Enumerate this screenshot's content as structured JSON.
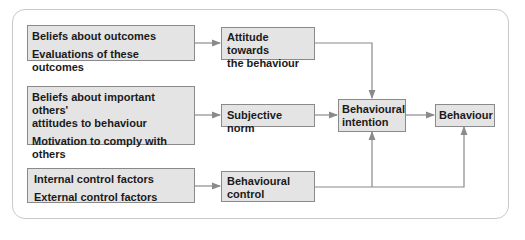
{
  "diagram": {
    "inputs": [
      {
        "lines": [
          "Beliefs about outcomes",
          "Evaluations of these outcomes"
        ]
      },
      {
        "lines": [
          "Beliefs about important others'",
          "attitudes to behaviour",
          "Motivation to comply with",
          "others"
        ]
      },
      {
        "lines": [
          "Internal control factors",
          "External control factors"
        ]
      }
    ],
    "mid": [
      {
        "lines": [
          "Attitude towards",
          "the behaviour"
        ]
      },
      {
        "lines": [
          "Subjective norm"
        ]
      },
      {
        "lines": [
          "Behavioural",
          "control"
        ]
      }
    ],
    "intention": {
      "lines": [
        "Behavioural",
        "intention"
      ]
    },
    "behaviour": {
      "label": "Behaviour"
    },
    "colors": {
      "box_fill": "#e4e4e4",
      "box_border": "#8a8a8a",
      "arrow": "#8a8a8a",
      "frame": "#c9c9c9"
    }
  }
}
